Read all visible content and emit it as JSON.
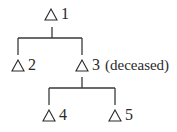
{
  "diagram": {
    "type": "pedigree",
    "nodes": [
      {
        "id": "1",
        "label": "1",
        "shape": "triangle",
        "note": ""
      },
      {
        "id": "2",
        "label": "2",
        "shape": "triangle",
        "note": ""
      },
      {
        "id": "3",
        "label": "3",
        "shape": "triangle",
        "note": "(deceased)"
      },
      {
        "id": "4",
        "label": "4",
        "shape": "triangle",
        "note": ""
      },
      {
        "id": "5",
        "label": "5",
        "shape": "triangle",
        "note": ""
      }
    ],
    "edges": [
      {
        "from": "1",
        "to": "2"
      },
      {
        "from": "1",
        "to": "3"
      },
      {
        "from": "3",
        "to": "4"
      },
      {
        "from": "3",
        "to": "5"
      }
    ],
    "line_color": "#3a3a3a"
  }
}
